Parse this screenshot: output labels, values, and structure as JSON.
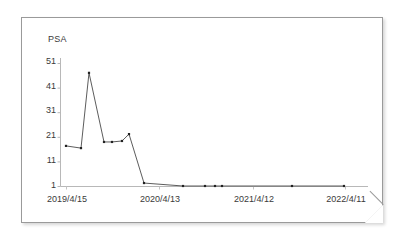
{
  "chart_data": {
    "type": "line",
    "title": "",
    "ylabel": "PSA",
    "xlabel": "",
    "ylim": [
      1,
      51
    ],
    "yticks": [
      1,
      11,
      21,
      31,
      41,
      51
    ],
    "ytick_labels": [
      "1",
      "11",
      "21",
      "31",
      "41",
      "51"
    ],
    "xtick_labels": [
      "2019/4/15",
      "2020/4/13",
      "2021/4/12",
      "2022/4/11"
    ],
    "xlim": [
      "2019/4/15",
      "2022/4/11"
    ],
    "grid": false,
    "legend": null,
    "marker": "dot",
    "line_color": "#4a4a4a",
    "marker_color": "#222222",
    "axis_color": "#9a9a9a",
    "series": [
      {
        "name": "PSA",
        "points": [
          {
            "x": "2019/4/15",
            "x_px": 66,
            "y": 17.3
          },
          {
            "x": "2019/6/10",
            "x_px": 81,
            "y": 16.4
          },
          {
            "x": "2019/8/05",
            "x_px": 89,
            "y": 47.0
          },
          {
            "x": "2019/10/01",
            "x_px": 104,
            "y": 18.9
          },
          {
            "x": "2019/11/20",
            "x_px": 112,
            "y": 18.9
          },
          {
            "x": "2020/01/15",
            "x_px": 122,
            "y": 19.3
          },
          {
            "x": "2020/02/20",
            "x_px": 129,
            "y": 22.1
          },
          {
            "x": "2020/05/10",
            "x_px": 144,
            "y": 2.2
          },
          {
            "x": "2020/09/15",
            "x_px": 183,
            "y": 1.0
          },
          {
            "x": "2021/01/10",
            "x_px": 205,
            "y": 1.0
          },
          {
            "x": "2021/03/05",
            "x_px": 215,
            "y": 1.0
          },
          {
            "x": "2021/04/20",
            "x_px": 222,
            "y": 1.0
          },
          {
            "x": "2021/09/15",
            "x_px": 292,
            "y": 1.0
          },
          {
            "x": "2022/04/11",
            "x_px": 344,
            "y": 1.0
          }
        ]
      }
    ]
  },
  "axis": {
    "y_label_text": "PSA",
    "y_labels": [
      "51",
      "41",
      "31",
      "21",
      "11",
      "1"
    ],
    "x_labels": [
      "2019/4/15",
      "2020/4/13",
      "2021/4/12",
      "2022/4/11"
    ]
  }
}
